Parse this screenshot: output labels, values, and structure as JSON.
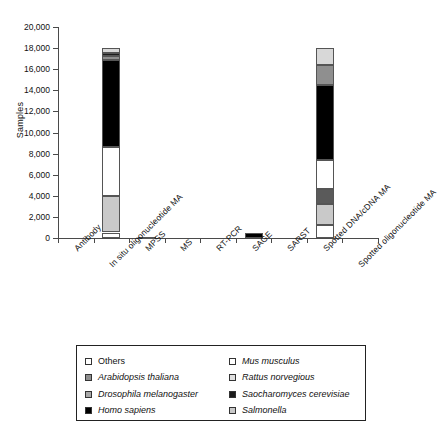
{
  "chart_data": {
    "type": "bar",
    "subtype": "stacked-vertical",
    "title": "",
    "xlabel": "",
    "ylabel": "Samples",
    "ylim": [
      0,
      20000
    ],
    "ytick_step": 2000,
    "ytick_labels": [
      "0",
      "2,000",
      "4,000",
      "6,000",
      "8,000",
      "10,000",
      "12,000",
      "14,000",
      "16,000",
      "18,000",
      "20,000"
    ],
    "grid": false,
    "legend_position": "bottom",
    "categories": [
      "Antibody",
      "In situ oligonucleotide MA",
      "MPSS",
      "MS",
      "RT-PCR",
      "SAGE",
      "SARST",
      "Spotted DNA/cDNA MA",
      "Spotted oligonucleotide MA"
    ],
    "series": [
      {
        "name": "Others",
        "key": "others",
        "swatch": "#ffffff",
        "values": [
          0,
          520,
          0,
          0,
          0,
          0,
          0,
          1200,
          0
        ]
      },
      {
        "name": "Arabidopsis thaliana",
        "key": "arabidopsis",
        "swatch": "#c9c9c9",
        "values": [
          0,
          3480,
          0,
          0,
          0,
          0,
          0,
          2000,
          0
        ]
      },
      {
        "name": "Drosophila melanogaster",
        "key": "drosophila",
        "swatch": "#5a5a5a",
        "values": [
          0,
          0,
          0,
          0,
          0,
          0,
          0,
          1400,
          0
        ]
      },
      {
        "name": "Homo sapiens",
        "key": "homo",
        "swatch": "#000000",
        "values": [
          0,
          8300,
          0,
          0,
          0,
          500,
          0,
          7100,
          0
        ]
      },
      {
        "name": "Mus musculus",
        "key": "mus",
        "swatch": "#ffffff",
        "values": [
          0,
          4600,
          0,
          0,
          0,
          0,
          0,
          2800,
          0
        ]
      },
      {
        "name": "Rattus norvegious",
        "key": "rattus",
        "swatch": "#8f8f8f",
        "values": [
          0,
          330,
          0,
          0,
          0,
          0,
          0,
          1900,
          0
        ]
      },
      {
        "name": "Saocharomyces cerevisiae",
        "key": "saccharomyces",
        "swatch": "#1c1c1c",
        "values": [
          0,
          330,
          0,
          0,
          0,
          0,
          0,
          0,
          0
        ]
      },
      {
        "name": "Salmonella",
        "key": "salmonella",
        "swatch": "#d8d8d8",
        "values": [
          0,
          440,
          120,
          0,
          0,
          0,
          0,
          1600,
          0
        ]
      }
    ],
    "totals": [
      0,
      18000,
      150,
      0,
      0,
      500,
      0,
      18000,
      3700
    ]
  },
  "axes": {
    "y_title": "Samples",
    "y_ticks": [
      "20,000",
      "18,000",
      "16,000",
      "14,000",
      "12,000",
      "10,000",
      "8,000",
      "6,000",
      "4,000",
      "2,000",
      "0"
    ],
    "x_ticks": [
      "Antibody",
      "In situ oligonucleotide MA",
      "MPSS",
      "MS",
      "RT-PCR",
      "SAGE",
      "SARST",
      "Spotted DNA/cDNA MA",
      "Spotted oligonucleotide MA"
    ]
  },
  "legend": {
    "left_column": [
      {
        "label": "Others",
        "italic": false,
        "swatch": "#ffffff"
      },
      {
        "label": "Arabidopsis thaliana",
        "italic": true,
        "swatch": "#8f8f8f"
      },
      {
        "label": "Drosophila melanogaster",
        "italic": true,
        "swatch": "#a8a8a8"
      },
      {
        "label": "Homo sapiens",
        "italic": true,
        "swatch": "#000000"
      }
    ],
    "right_column": [
      {
        "label": "Mus musculus",
        "italic": true,
        "swatch": "#ffffff"
      },
      {
        "label": "Rattus norvegious",
        "italic": true,
        "swatch": "#e0e0e0"
      },
      {
        "label": "Saocharomyces cerevisiae",
        "italic": true,
        "swatch": "#1c1c1c"
      },
      {
        "label": "Salmonella",
        "italic": true,
        "swatch": "#c9c9c9"
      }
    ]
  },
  "colors": {
    "axis": "#4a4a4a",
    "text": "#111111",
    "background": "#ffffff",
    "outline": "#555555"
  }
}
